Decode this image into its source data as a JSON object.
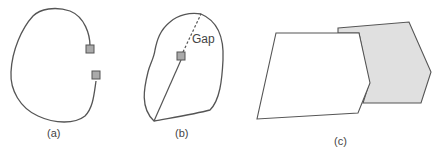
{
  "panels": [
    {
      "id": "a",
      "label": "(a)",
      "description": "Open curve with two gray square endpoints"
    },
    {
      "id": "b",
      "label": "(b)",
      "description": "Closed blob with interior point; solid line to boundary and dashed gap line",
      "annotation": "Gap"
    },
    {
      "id": "c",
      "label": "(c)",
      "description": "White quadrilateral overlapping gray polygon"
    }
  ],
  "colors": {
    "stroke": "#555555",
    "marker_fill": "#aaaaaa",
    "shaded_fill": "#e0e0e0",
    "background": "#ffffff"
  }
}
